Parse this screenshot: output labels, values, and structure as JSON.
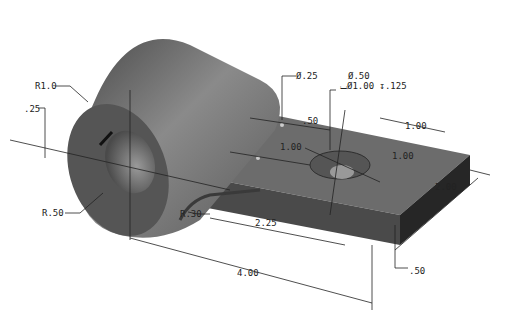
{
  "drawing": {
    "title": "Isometric part drawing with dimensions",
    "colors": {
      "part_dark": "#3a3a3a",
      "part_mid": "#6f6f6f",
      "part_light": "#9a9a9a",
      "line": "#222222",
      "background": "#ffffff"
    },
    "dimensions": {
      "outer_radius": "R1.0",
      "slot_offset": ".25",
      "bore_radius": "R.50",
      "fillet_radius": "R.30",
      "small_hole_dia": "Ø.25",
      "cbore_hole_dia": "Ø.50",
      "cbore_spec": "⌴Ø1.00 ↧.125",
      "hole_spacing_x": ".50",
      "hole_spacing_y": "1.00",
      "cbore_from_end": "1.00",
      "cbore_from_edge": "1.00",
      "width": "2.00",
      "center_to_hole": "2.25",
      "overall_length": "4.00",
      "thickness": ".50"
    }
  }
}
